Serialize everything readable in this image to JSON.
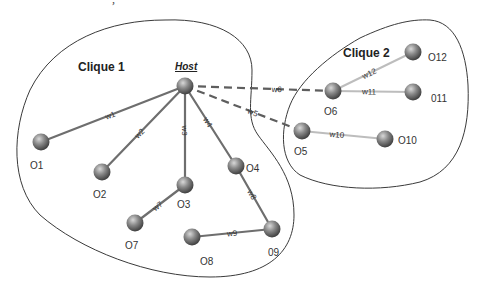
{
  "diagram": {
    "type": "network-graph",
    "host": {
      "id": "Host",
      "label": "Host"
    },
    "cliques": [
      {
        "id": "clique1",
        "label": "Clique 1",
        "members": [
          "Host",
          "O1",
          "O2",
          "O3",
          "O4",
          "O7",
          "O8",
          "O9"
        ]
      },
      {
        "id": "clique2",
        "label": "Clique 2",
        "members": [
          "O5",
          "O6",
          "O10",
          "O11",
          "O12"
        ]
      }
    ],
    "nodes": [
      {
        "id": "Host",
        "label": "Host"
      },
      {
        "id": "O1",
        "label": "O1"
      },
      {
        "id": "O2",
        "label": "O2"
      },
      {
        "id": "O3",
        "label": "O3"
      },
      {
        "id": "O4",
        "label": "O4"
      },
      {
        "id": "O5",
        "label": "O5"
      },
      {
        "id": "O6",
        "label": "O6"
      },
      {
        "id": "O7",
        "label": "O7"
      },
      {
        "id": "O8",
        "label": "O8"
      },
      {
        "id": "O9",
        "label": "09"
      },
      {
        "id": "O10",
        "label": "O10"
      },
      {
        "id": "O11",
        "label": "011"
      },
      {
        "id": "O12",
        "label": "O12"
      }
    ],
    "edges": [
      {
        "id": "w1",
        "label": "w1",
        "from": "Host",
        "to": "O1",
        "style": "solid-dark"
      },
      {
        "id": "w2",
        "label": "w2",
        "from": "Host",
        "to": "O2",
        "style": "solid-dark"
      },
      {
        "id": "w3",
        "label": "w3",
        "from": "Host",
        "to": "O3",
        "style": "solid-dark"
      },
      {
        "id": "w4",
        "label": "w4",
        "from": "Host",
        "to": "O4",
        "style": "solid-dark"
      },
      {
        "id": "w5",
        "label": "w5",
        "from": "Host",
        "to": "O5",
        "style": "dashed"
      },
      {
        "id": "w6",
        "label": "w6",
        "from": "Host",
        "to": "O6",
        "style": "dashed"
      },
      {
        "id": "w7",
        "label": "w7",
        "from": "O3",
        "to": "O7",
        "style": "solid-dark"
      },
      {
        "id": "w8",
        "label": "w8",
        "from": "O4",
        "to": "O9",
        "style": "solid-dark"
      },
      {
        "id": "w9",
        "label": "w9",
        "from": "O8",
        "to": "O9",
        "style": "solid-dark"
      },
      {
        "id": "w10",
        "label": "w10",
        "from": "O5",
        "to": "O10",
        "style": "solid-light"
      },
      {
        "id": "w11",
        "label": "w11",
        "from": "O6",
        "to": "O11",
        "style": "solid-light"
      },
      {
        "id": "w12",
        "label": "w12",
        "from": "O6",
        "to": "O12",
        "style": "solid-light"
      }
    ],
    "colors": {
      "node": "#6a6a6a",
      "edge_dark": "#6e6e6e",
      "edge_light": "#bdbdbd",
      "outline": "#3a3a3a"
    }
  }
}
